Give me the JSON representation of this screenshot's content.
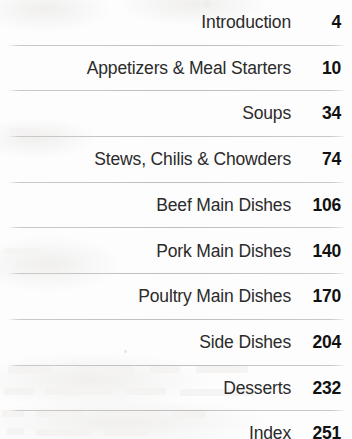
{
  "document": {
    "type": "table-of-contents",
    "page_background_color": "#fdfdfd",
    "title_text_color": "#2b2b2b",
    "page_number_color": "#111111",
    "divider_color": "#bfbfbf"
  },
  "contents": {
    "entries": [
      {
        "title": "Introduction",
        "page": "4"
      },
      {
        "title": "Appetizers & Meal Starters",
        "page": "10"
      },
      {
        "title": "Soups",
        "page": "34"
      },
      {
        "title": "Stews, Chilis & Chowders",
        "page": "74"
      },
      {
        "title": "Beef Main Dishes",
        "page": "106"
      },
      {
        "title": "Pork Main Dishes",
        "page": "140"
      },
      {
        "title": "Poultry Main Dishes",
        "page": "170"
      },
      {
        "title": "Side Dishes",
        "page": "204"
      },
      {
        "title": "Desserts",
        "page": "232"
      },
      {
        "title": "Index",
        "page": "251"
      }
    ]
  }
}
